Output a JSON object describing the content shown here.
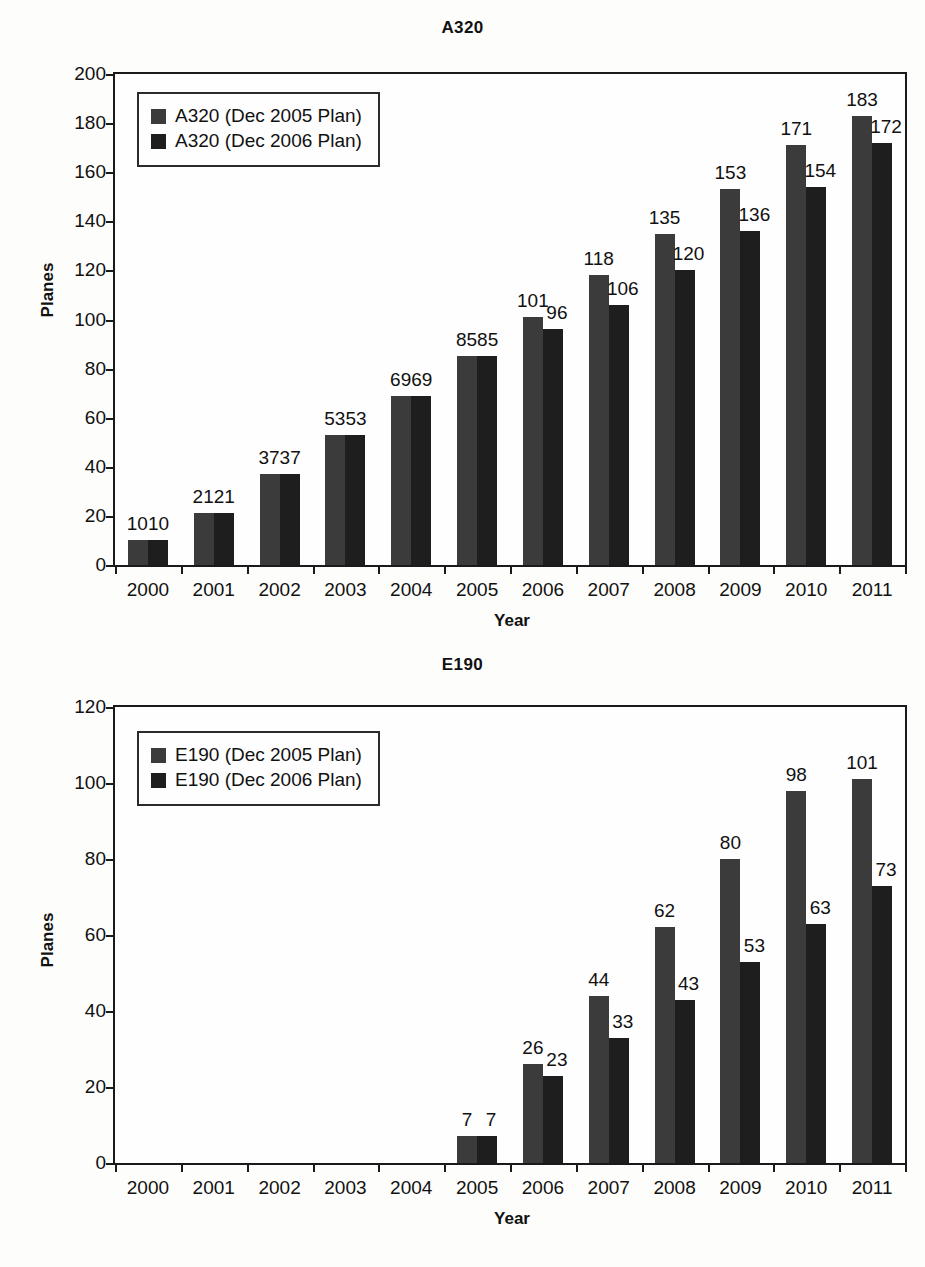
{
  "charts": [
    {
      "title": "A320",
      "ylabel": "Planes",
      "xlabel": "Year",
      "legend": [
        {
          "label": "A320 (Dec 2005 Plan)",
          "color": "#3b3b3b"
        },
        {
          "label": "A320 (Dec 2006 Plan)",
          "color": "#1e1e1e"
        }
      ]
    },
    {
      "title": "E190",
      "ylabel": "Planes",
      "xlabel": "Year",
      "legend": [
        {
          "label": "E190 (Dec 2005 Plan)",
          "color": "#3b3b3b"
        },
        {
          "label": "E190 (Dec 2006 Plan)",
          "color": "#1e1e1e"
        }
      ]
    }
  ],
  "chart_data": [
    {
      "type": "bar",
      "title": "A320",
      "xlabel": "Year",
      "ylabel": "Planes",
      "ylim": [
        0,
        200
      ],
      "yticks": [
        0,
        20,
        40,
        60,
        80,
        100,
        120,
        140,
        160,
        180,
        200
      ],
      "grid": false,
      "legend_position": "top-left",
      "categories": [
        "2000",
        "2001",
        "2002",
        "2003",
        "2004",
        "2005",
        "2006",
        "2007",
        "2008",
        "2009",
        "2010",
        "2011"
      ],
      "series": [
        {
          "name": "A320 (Dec 2005 Plan)",
          "color": "#3b3b3b",
          "values": [
            10,
            21,
            37,
            53,
            69,
            85,
            101,
            118,
            135,
            153,
            171,
            183
          ]
        },
        {
          "name": "A320 (Dec 2006 Plan)",
          "color": "#1e1e1e",
          "values": [
            10,
            21,
            37,
            53,
            69,
            85,
            96,
            106,
            120,
            136,
            154,
            172
          ]
        }
      ],
      "data_labels": [
        {
          "text": "1010",
          "merged": true
        },
        {
          "text": "2121",
          "merged": true
        },
        {
          "text": "3737",
          "merged": true
        },
        {
          "text": "5353",
          "merged": true
        },
        {
          "text": "6969",
          "merged": true
        },
        {
          "text": "8585",
          "merged": true
        },
        {
          "text": [
            "101",
            "96"
          ],
          "merged": false
        },
        {
          "text": [
            "118",
            "106"
          ],
          "merged": false
        },
        {
          "text": [
            "135",
            "120"
          ],
          "merged": false
        },
        {
          "text": [
            "153",
            "136"
          ],
          "merged": false
        },
        {
          "text": [
            "171",
            "154"
          ],
          "merged": false
        },
        {
          "text": [
            "183",
            "172"
          ],
          "merged": false
        }
      ]
    },
    {
      "type": "bar",
      "title": "E190",
      "xlabel": "Year",
      "ylabel": "Planes",
      "ylim": [
        0,
        120
      ],
      "yticks": [
        0,
        20,
        40,
        60,
        80,
        100,
        120
      ],
      "grid": false,
      "legend_position": "top-left",
      "categories": [
        "2000",
        "2001",
        "2002",
        "2003",
        "2004",
        "2005",
        "2006",
        "2007",
        "2008",
        "2009",
        "2010",
        "2011"
      ],
      "series": [
        {
          "name": "E190 (Dec 2005 Plan)",
          "color": "#3b3b3b",
          "values": [
            0,
            0,
            0,
            0,
            0,
            7,
            26,
            44,
            62,
            80,
            98,
            101
          ]
        },
        {
          "name": "E190 (Dec 2006 Plan)",
          "color": "#1e1e1e",
          "values": [
            0,
            0,
            0,
            0,
            0,
            7,
            23,
            33,
            43,
            53,
            63,
            73
          ]
        }
      ],
      "data_labels": [
        {
          "text": null,
          "merged": false
        },
        {
          "text": null,
          "merged": false
        },
        {
          "text": null,
          "merged": false
        },
        {
          "text": null,
          "merged": false
        },
        {
          "text": null,
          "merged": false
        },
        {
          "text": [
            "7",
            "7"
          ],
          "merged": false
        },
        {
          "text": [
            "26",
            "23"
          ],
          "merged": false
        },
        {
          "text": [
            "44",
            "33"
          ],
          "merged": false
        },
        {
          "text": [
            "62",
            "43"
          ],
          "merged": false
        },
        {
          "text": [
            "80",
            "53"
          ],
          "merged": false
        },
        {
          "text": [
            "98",
            "63"
          ],
          "merged": false
        },
        {
          "text": [
            "101",
            "73"
          ],
          "merged": false
        }
      ]
    }
  ]
}
